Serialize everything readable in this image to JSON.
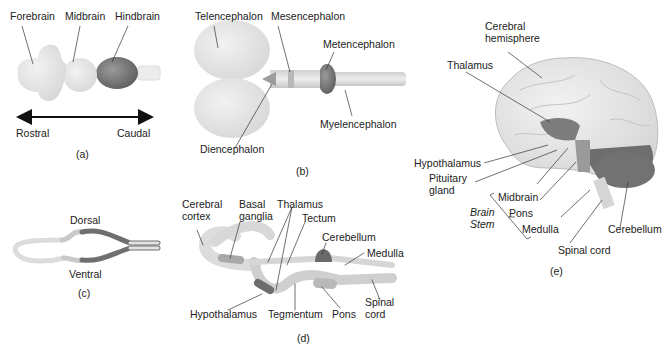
{
  "panels": {
    "a": {
      "caption": "(a)",
      "labels": {
        "forebrain": "Forebrain",
        "midbrain": "Midbrain",
        "hindbrain": "Hindbrain"
      },
      "axis": {
        "left": "Rostral",
        "right": "Caudal"
      }
    },
    "b": {
      "caption": "(b)",
      "labels": {
        "telencephalon": "Telencephalon",
        "mesencephalon": "Mesencephalon",
        "metencephalon": "Metencephalon",
        "myelencephalon": "Myelencephalon",
        "diencephalon": "Diencephalon"
      }
    },
    "c": {
      "caption": "(c)",
      "labels": {
        "dorsal": "Dorsal",
        "ventral": "Ventral"
      }
    },
    "d": {
      "caption": "(d)",
      "labels": {
        "cerebral_cortex_1": "Cerebral",
        "cerebral_cortex_2": "cortex",
        "basal_ganglia_1": "Basal",
        "basal_ganglia_2": "ganglia",
        "thalamus": "Thalamus",
        "tectum": "Tectum",
        "cerebellum": "Cerebellum",
        "medulla": "Medulla",
        "hypothalamus": "Hypothalamus",
        "tegmentum": "Tegmentum",
        "pons": "Pons",
        "spinal_cord_1": "Spinal",
        "spinal_cord_2": "cord"
      }
    },
    "e": {
      "caption": "(e)",
      "labels": {
        "cerebral_hemisphere_1": "Cerebral",
        "cerebral_hemisphere_2": "hemisphere",
        "thalamus": "Thalamus",
        "hypothalamus": "Hypothalamus",
        "pituitary_1": "Pituitary",
        "pituitary_2": "gland",
        "midbrain": "Midbrain",
        "pons": "Pons",
        "medulla": "Medulla",
        "brain_stem_1": "Brain",
        "brain_stem_2": "Stem",
        "spinal_cord": "Spinal cord",
        "cerebellum": "Cerebellum"
      }
    }
  },
  "colors": {
    "light": "#e6e6e6",
    "mid": "#c8c8c8",
    "dark": "#7a7a7a",
    "darker": "#5e5e5e"
  }
}
